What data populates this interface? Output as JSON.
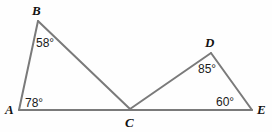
{
  "figure": {
    "background_color": "#fefefe",
    "stroke_color": "#7a7a7a",
    "stroke_width": 2,
    "label_color": "#121212",
    "width": 272,
    "height": 132
  },
  "vertices": [
    {
      "name": "A",
      "label": "A",
      "x": 19,
      "y": 110,
      "label_x": 5,
      "label_y": 103
    },
    {
      "name": "B",
      "label": "B",
      "x": 38,
      "y": 21,
      "label_x": 32,
      "label_y": 4
    },
    {
      "name": "C",
      "label": "C",
      "x": 130,
      "y": 109,
      "label_x": 125,
      "label_y": 116
    },
    {
      "name": "D",
      "label": "D",
      "x": 211,
      "y": 53,
      "label_x": 205,
      "label_y": 36
    },
    {
      "name": "E",
      "label": "E",
      "x": 252,
      "y": 110,
      "label_x": 257,
      "label_y": 103
    }
  ],
  "segments": [
    {
      "name": "segment-AB",
      "from": "A",
      "to": "B"
    },
    {
      "name": "segment-BC",
      "from": "B",
      "to": "C"
    },
    {
      "name": "segment-AE",
      "from": "A",
      "to": "E"
    },
    {
      "name": "segment-CD",
      "from": "C",
      "to": "D"
    },
    {
      "name": "segment-DE",
      "from": "D",
      "to": "E"
    }
  ],
  "angles": [
    {
      "name": "angle-A",
      "vertex": "A",
      "value": 78,
      "label": "78°",
      "label_x": 25,
      "label_y": 97
    },
    {
      "name": "angle-B",
      "vertex": "B",
      "value": 58,
      "label": "58°",
      "label_x": 36,
      "label_y": 37
    },
    {
      "name": "angle-D",
      "vertex": "D",
      "value": 85,
      "label": "85°",
      "label_x": 198,
      "label_y": 63
    },
    {
      "name": "angle-E",
      "vertex": "E",
      "value": 60,
      "label": "60°",
      "label_x": 216,
      "label_y": 96
    }
  ],
  "triangles": [
    {
      "name": "triangle-ABC",
      "vertices": "ABC"
    },
    {
      "name": "triangle-CDE",
      "vertices": "CDE"
    }
  ]
}
